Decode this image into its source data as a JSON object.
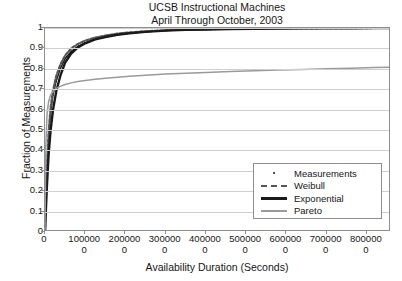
{
  "title": {
    "line1": "UCSB Instructional Machines",
    "line2": "April Through October, 2003"
  },
  "axes": {
    "xlabel": "Availability Duration (Seconds)",
    "ylabel": "Fraction of Measurements"
  },
  "legend": {
    "items": [
      {
        "label": "Measurements",
        "marker": "dot",
        "color": "#1a1a1a"
      },
      {
        "label": "Weibull",
        "marker": "dashed-line",
        "color": "#555555"
      },
      {
        "label": "Exponential",
        "marker": "thick-line",
        "color": "#1a1a1a"
      },
      {
        "label": "Pareto",
        "marker": "gray-line",
        "color": "#9a9a9a"
      }
    ]
  },
  "chart_data": {
    "type": "line",
    "title": "UCSB Instructional Machines April Through October, 2003",
    "xlabel": "Availability Duration (Seconds)",
    "ylabel": "Fraction of Measurements",
    "xlim": [
      0,
      8600000
    ],
    "ylim": [
      0,
      1
    ],
    "grid": "horizontal",
    "legend_position": "lower-right",
    "xticks": [
      0,
      1000000,
      2000000,
      3000000,
      4000000,
      5000000,
      6000000,
      7000000,
      8000000
    ],
    "xticklabels": [
      "0",
      "1000000",
      "2000000",
      "3000000",
      "4000000",
      "5000000",
      "6000000",
      "7000000",
      "8000000"
    ],
    "yticks": [
      0,
      0.1,
      0.2,
      0.3,
      0.4,
      0.5,
      0.6,
      0.7,
      0.8,
      0.9,
      1
    ],
    "yticklabels": [
      "0",
      "0.1",
      "0.2",
      "0.3",
      "0.4",
      "0.5",
      "0.6",
      "0.7",
      "0.8",
      "0.9",
      "1"
    ],
    "series": [
      {
        "name": "Measurements",
        "style": "dots",
        "color": "#1a1a1a",
        "x": [
          0,
          20000,
          50000,
          90000,
          140000,
          200000,
          280000,
          380000,
          500000,
          650000,
          820000,
          1000000,
          1250000,
          1500000,
          1800000,
          2100000,
          2500000,
          3000000,
          3500000,
          4000000,
          4600000,
          5200000,
          5800000,
          6400000,
          7000000,
          7600000,
          8200000,
          8600000
        ],
        "y": [
          0.0,
          0.13,
          0.3,
          0.46,
          0.58,
          0.67,
          0.74,
          0.8,
          0.85,
          0.885,
          0.91,
          0.928,
          0.945,
          0.957,
          0.967,
          0.974,
          0.981,
          0.987,
          0.99,
          0.992,
          0.994,
          0.996,
          0.997,
          0.998,
          0.998,
          0.999,
          0.999,
          1.0
        ]
      },
      {
        "name": "Weibull",
        "style": "dashed",
        "color": "#555555",
        "x": [
          0,
          20000,
          50000,
          90000,
          140000,
          200000,
          280000,
          380000,
          500000,
          650000,
          820000,
          1000000,
          1250000,
          1500000,
          1800000,
          2100000,
          2500000,
          3000000,
          3500000,
          4000000,
          4600000,
          5200000,
          5800000,
          6400000,
          7000000,
          7600000,
          8200000,
          8600000
        ],
        "y": [
          0.0,
          0.155,
          0.33,
          0.49,
          0.61,
          0.695,
          0.765,
          0.82,
          0.865,
          0.9,
          0.922,
          0.938,
          0.953,
          0.963,
          0.972,
          0.978,
          0.984,
          0.989,
          0.992,
          0.994,
          0.996,
          0.997,
          0.998,
          0.998,
          0.999,
          0.999,
          1.0,
          1.0
        ]
      },
      {
        "name": "Exponential",
        "style": "solid-thick",
        "color": "#1a1a1a",
        "x": [
          0,
          20000,
          50000,
          90000,
          140000,
          200000,
          280000,
          380000,
          500000,
          650000,
          820000,
          1000000,
          1250000,
          1500000,
          1800000,
          2100000,
          2500000,
          3000000,
          3500000,
          4000000,
          4600000,
          5200000,
          5800000,
          6400000,
          7000000,
          7600000,
          8200000,
          8600000
        ],
        "y": [
          0.0,
          0.1,
          0.235,
          0.38,
          0.5,
          0.6,
          0.69,
          0.765,
          0.83,
          0.875,
          0.905,
          0.925,
          0.944,
          0.956,
          0.967,
          0.974,
          0.981,
          0.987,
          0.991,
          0.993,
          0.995,
          0.996,
          0.997,
          0.998,
          0.999,
          0.999,
          1.0,
          1.0
        ]
      },
      {
        "name": "Pareto",
        "style": "solid-gray",
        "color": "#9a9a9a",
        "x": [
          0,
          20000,
          50000,
          90000,
          140000,
          200000,
          280000,
          380000,
          500000,
          650000,
          820000,
          1000000,
          1250000,
          1500000,
          1800000,
          2100000,
          2500000,
          3000000,
          3500000,
          4000000,
          4600000,
          5200000,
          5800000,
          6400000,
          7000000,
          7600000,
          8200000,
          8600000
        ],
        "y": [
          0.0,
          0.42,
          0.575,
          0.64,
          0.672,
          0.69,
          0.704,
          0.714,
          0.723,
          0.731,
          0.738,
          0.743,
          0.749,
          0.754,
          0.759,
          0.763,
          0.768,
          0.774,
          0.778,
          0.782,
          0.787,
          0.791,
          0.794,
          0.797,
          0.8,
          0.803,
          0.806,
          0.808
        ]
      }
    ]
  }
}
